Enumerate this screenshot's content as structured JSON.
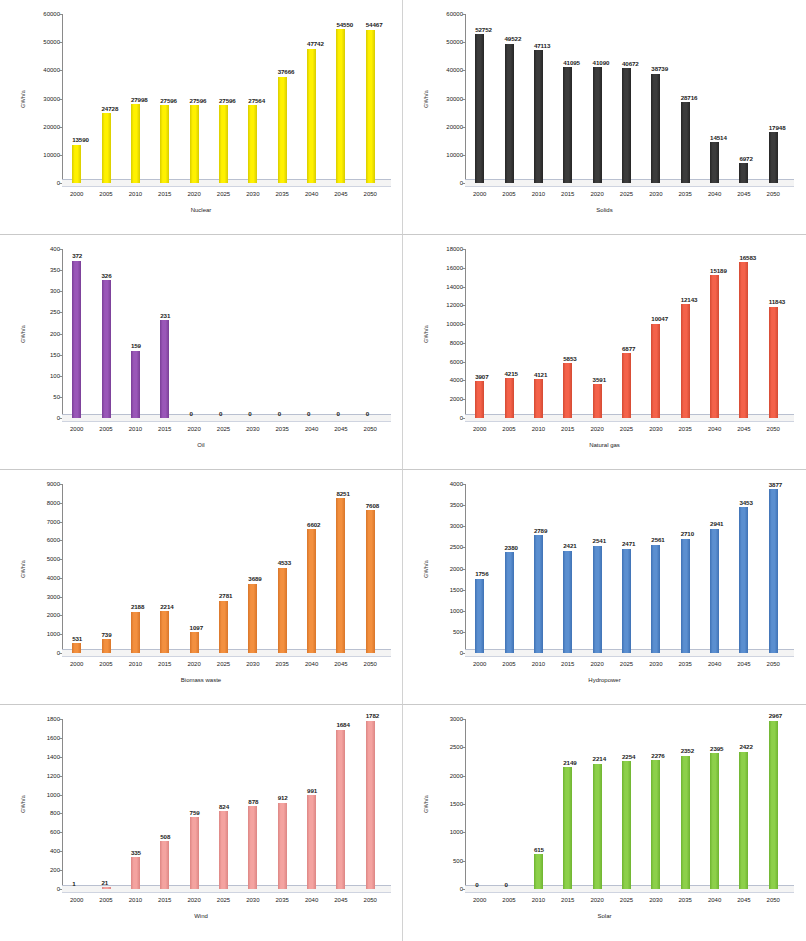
{
  "figure": {
    "layout": "2 columns x 4 rows of bar charts",
    "background": "#ffffff",
    "divider_color": "#d2d2d2"
  },
  "chart_data": [
    {
      "type": "bar",
      "title": "",
      "xlabel": "Nuclear",
      "ylabel": "GWh/a",
      "categories": [
        "2000",
        "2005",
        "2010",
        "2015",
        "2020",
        "2025",
        "2030",
        "2035",
        "2040",
        "2045",
        "2050"
      ],
      "values": [
        13590,
        24728,
        27998,
        27596,
        27596,
        27596,
        27564,
        37666,
        47742,
        54550,
        54467
      ],
      "labels": [
        "13590",
        "24728",
        "27998",
        "27596",
        "27596",
        "27596",
        "27564",
        "37666",
        "47742",
        "54550",
        "54467"
      ],
      "ylim": [
        0,
        60000
      ],
      "yticks": [
        0,
        10000,
        20000,
        30000,
        40000,
        50000,
        60000
      ],
      "ytick_labels": [
        "0",
        "10000",
        "20000",
        "30000",
        "40000",
        "50000",
        "60000"
      ],
      "bar_color": "#FFF100",
      "bar_edge": "#d8cc00",
      "grid": false,
      "legend": "none"
    },
    {
      "type": "bar",
      "title": "",
      "xlabel": "Solids",
      "ylabel": "GWh/a",
      "categories": [
        "2000",
        "2005",
        "2010",
        "2015",
        "2020",
        "2025",
        "2030",
        "2035",
        "2040",
        "2045",
        "2050"
      ],
      "values": [
        52752,
        49522,
        47113,
        41095,
        41090,
        40672,
        38739,
        28716,
        14514,
        6972,
        17948
      ],
      "labels": [
        "52752",
        "49522",
        "47113",
        "41095",
        "41090",
        "40672",
        "38739",
        "28716",
        "14514",
        "6972",
        "17948"
      ],
      "ylim": [
        0,
        60000
      ],
      "yticks": [
        0,
        10000,
        20000,
        30000,
        40000,
        50000,
        60000
      ],
      "ytick_labels": [
        "0",
        "10000",
        "20000",
        "30000",
        "40000",
        "50000",
        "60000"
      ],
      "bar_color": "#3C3C3C",
      "bar_edge": "#262626",
      "grid": false,
      "legend": "none"
    },
    {
      "type": "bar",
      "title": "",
      "xlabel": "Oil",
      "ylabel": "GWh/a",
      "categories": [
        "2000",
        "2005",
        "2010",
        "2015",
        "2020",
        "2025",
        "2030",
        "2035",
        "2040",
        "2045",
        "2050"
      ],
      "values": [
        372,
        326,
        159,
        231,
        0,
        0,
        0,
        0,
        0,
        0,
        0
      ],
      "labels": [
        "372",
        "326",
        "159",
        "231",
        "0",
        "0",
        "0",
        "0",
        "0",
        "0",
        "0"
      ],
      "ylim": [
        0,
        400
      ],
      "yticks": [
        0,
        50,
        100,
        150,
        200,
        250,
        300,
        350,
        400
      ],
      "ytick_labels": [
        "0",
        "50",
        "100",
        "150",
        "200",
        "250",
        "300",
        "350",
        "400"
      ],
      "bar_color": "#9A57B8",
      "bar_edge": "#7a3f97",
      "grid": false,
      "legend": "none"
    },
    {
      "type": "bar",
      "title": "",
      "xlabel": "Natural gas",
      "ylabel": "GWh/a",
      "categories": [
        "2000",
        "2005",
        "2010",
        "2015",
        "2020",
        "2025",
        "2030",
        "2035",
        "2040",
        "2045",
        "2050"
      ],
      "values": [
        3907,
        4215,
        4121,
        5853,
        3591,
        6877,
        10047,
        12143,
        15189,
        16583,
        11843
      ],
      "labels": [
        "3907",
        "4215",
        "4121",
        "5853",
        "3591",
        "6877",
        "10047",
        "12143",
        "15189",
        "16583",
        "11843"
      ],
      "ylim": [
        0,
        18000
      ],
      "yticks": [
        0,
        2000,
        4000,
        6000,
        8000,
        10000,
        12000,
        14000,
        16000,
        18000
      ],
      "ytick_labels": [
        "0",
        "2000",
        "4000",
        "6000",
        "8000",
        "10000",
        "12000",
        "14000",
        "16000",
        "18000"
      ],
      "bar_color": "#F4624A",
      "bar_edge": "#d44a33",
      "grid": false,
      "legend": "none"
    },
    {
      "type": "bar",
      "title": "",
      "xlabel": "Biomass waste",
      "ylabel": "GWh/a",
      "categories": [
        "2000",
        "2005",
        "2010",
        "2015",
        "2020",
        "2025",
        "2030",
        "2035",
        "2040",
        "2045",
        "2050"
      ],
      "values": [
        531,
        739,
        2188,
        2214,
        1097,
        2781,
        3689,
        4533,
        6602,
        8251,
        7608
      ],
      "labels": [
        "531",
        "739",
        "2188",
        "2214",
        "1097",
        "2781",
        "3689",
        "4533",
        "6602",
        "8251",
        "7608"
      ],
      "ylim": [
        0,
        9000
      ],
      "yticks": [
        0,
        1000,
        2000,
        3000,
        4000,
        5000,
        6000,
        7000,
        8000,
        9000
      ],
      "ytick_labels": [
        "0",
        "1000",
        "2000",
        "3000",
        "4000",
        "5000",
        "6000",
        "7000",
        "8000",
        "9000"
      ],
      "bar_color": "#F3903F",
      "bar_edge": "#d9762a",
      "grid": false,
      "legend": "none"
    },
    {
      "type": "bar",
      "title": "",
      "xlabel": "Hydropower",
      "ylabel": "GWh/a",
      "categories": [
        "2000",
        "2005",
        "2010",
        "2015",
        "2020",
        "2025",
        "2030",
        "2035",
        "2040",
        "2045",
        "2050"
      ],
      "values": [
        1756,
        2380,
        2789,
        2421,
        2541,
        2471,
        2561,
        2710,
        2941,
        3453,
        3877
      ],
      "labels": [
        "1756",
        "2380",
        "2789",
        "2421",
        "2541",
        "2471",
        "2561",
        "2710",
        "2941",
        "3453",
        "3877"
      ],
      "ylim": [
        0,
        4000
      ],
      "yticks": [
        0,
        500,
        1000,
        1500,
        2000,
        2500,
        3000,
        3500,
        4000
      ],
      "ytick_labels": [
        "0",
        "500",
        "1000",
        "1500",
        "2000",
        "2500",
        "3000",
        "3500",
        "4000"
      ],
      "bar_color": "#5B8FD0",
      "bar_edge": "#3f72b5",
      "grid": false,
      "legend": "none"
    },
    {
      "type": "bar",
      "title": "",
      "xlabel": "Wind",
      "ylabel": "GWh/a",
      "categories": [
        "2000",
        "2005",
        "2010",
        "2015",
        "2020",
        "2025",
        "2030",
        "2035",
        "2040",
        "2045",
        "2050"
      ],
      "values": [
        1,
        21,
        335,
        508,
        759,
        824,
        878,
        912,
        991,
        1684,
        1782
      ],
      "labels": [
        "1",
        "21",
        "335",
        "508",
        "759",
        "824",
        "878",
        "912",
        "991",
        "1684",
        "1782"
      ],
      "ylim": [
        0,
        1800
      ],
      "yticks": [
        0,
        200,
        400,
        600,
        800,
        1000,
        1200,
        1400,
        1600,
        1800
      ],
      "ytick_labels": [
        "0",
        "200",
        "400",
        "600",
        "800",
        "1000",
        "1200",
        "1400",
        "1600",
        "1800"
      ],
      "bar_color": "#F4A3A0",
      "bar_edge": "#dd8684",
      "grid": false,
      "legend": "none"
    },
    {
      "type": "bar",
      "title": "",
      "xlabel": "Solar",
      "ylabel": "GWh/a",
      "categories": [
        "2000",
        "2005",
        "2010",
        "2015",
        "2020",
        "2025",
        "2030",
        "2035",
        "2040",
        "2045",
        "2050"
      ],
      "values": [
        0,
        0,
        615,
        2149,
        2214,
        2254,
        2276,
        2352,
        2395,
        2422,
        2967
      ],
      "labels": [
        "0",
        "0",
        "615",
        "2149",
        "2214",
        "2254",
        "2276",
        "2352",
        "2395",
        "2422",
        "2967"
      ],
      "ylim": [
        0,
        3000
      ],
      "yticks": [
        0,
        500,
        1000,
        1500,
        2000,
        2500,
        3000
      ],
      "ytick_labels": [
        "0",
        "500",
        "1000",
        "1500",
        "2000",
        "2500",
        "3000"
      ],
      "bar_color": "#8DD04A",
      "bar_edge": "#6fb431",
      "grid": false,
      "legend": "none"
    }
  ]
}
